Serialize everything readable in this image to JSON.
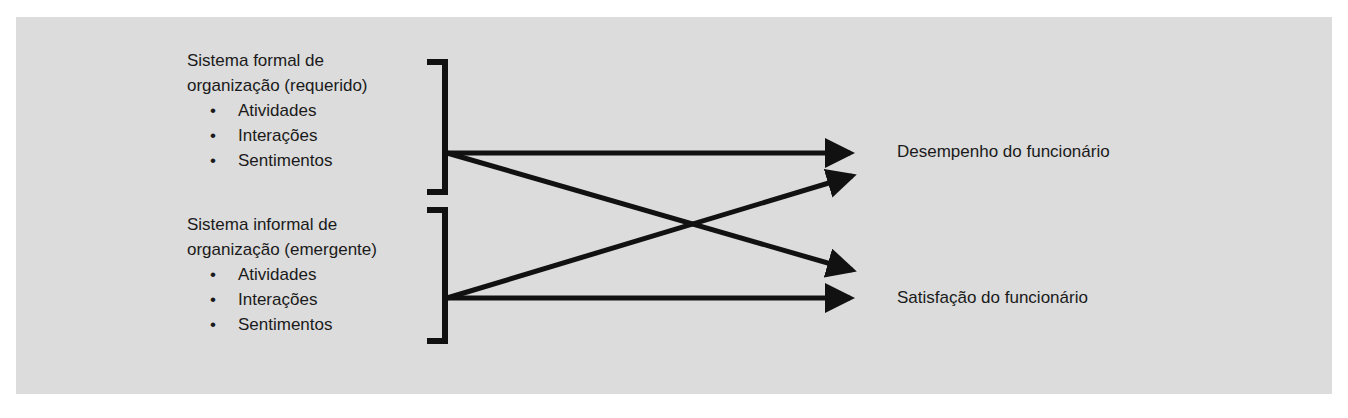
{
  "diagram": {
    "inputs": [
      {
        "title_line1": "Sistema formal de",
        "title_line2": "organização (requerido)",
        "items": [
          "Atividades",
          "Interações",
          "Sentimentos"
        ]
      },
      {
        "title_line1": "Sistema informal de",
        "title_line2": "organização (emergente)",
        "items": [
          "Atividades",
          "Interações",
          "Sentimentos"
        ]
      }
    ],
    "bullet": "•",
    "outputs": [
      {
        "label": "Desempenho do funcionário"
      },
      {
        "label": "Satisfação do funcionário"
      }
    ],
    "edges": [
      {
        "from": "Sistema formal",
        "to": "Desempenho do funcionário"
      },
      {
        "from": "Sistema formal",
        "to": "Satisfação do funcionário"
      },
      {
        "from": "Sistema informal",
        "to": "Desempenho do funcionário"
      },
      {
        "from": "Sistema informal",
        "to": "Satisfação do funcionário"
      }
    ],
    "colors": {
      "background": "#dcdcdc",
      "ink": "#111111"
    }
  }
}
